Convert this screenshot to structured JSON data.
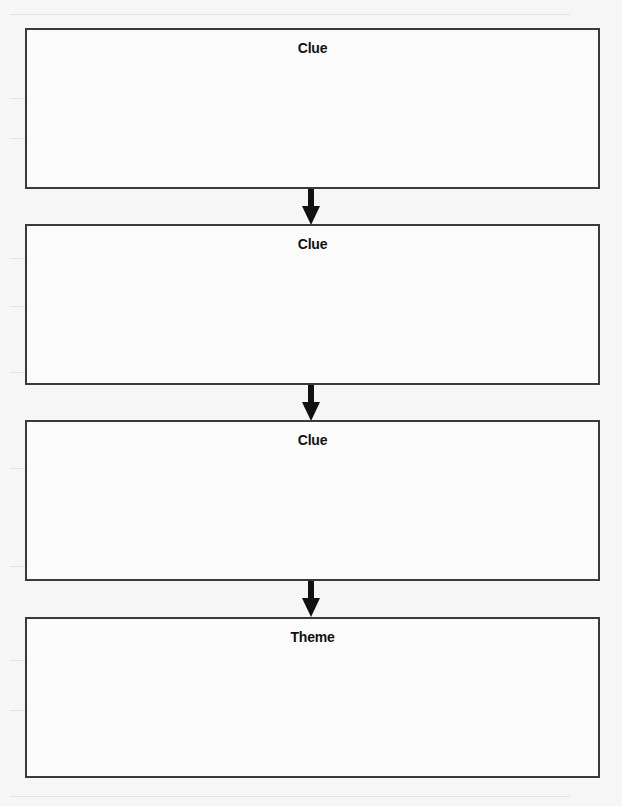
{
  "diagram": {
    "type": "vertical-flowchart",
    "colors": {
      "page_background": "#f6f6f6",
      "box_border": "#3a3a3a",
      "box_fill": "#fbfbfb",
      "label": "#111111",
      "arrow": "#111111"
    },
    "boxes": [
      {
        "label": "Clue"
      },
      {
        "label": "Clue"
      },
      {
        "label": "Clue"
      },
      {
        "label": "Theme"
      }
    ],
    "connectors": [
      {
        "from": 0,
        "to": 1,
        "direction": "down"
      },
      {
        "from": 1,
        "to": 2,
        "direction": "down"
      },
      {
        "from": 2,
        "to": 3,
        "direction": "down"
      }
    ]
  }
}
